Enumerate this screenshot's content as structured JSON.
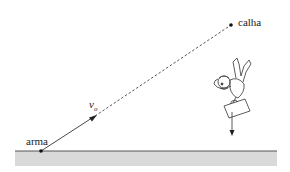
{
  "diagram": {
    "labels": {
      "gun": "arma",
      "gutter": "calha",
      "velocity": "v",
      "velocity_subscript": "o"
    },
    "colors": {
      "ground": "#d9d9d9",
      "ground_line": "#555555",
      "line": "#333333"
    },
    "points": {
      "gun": {
        "x": 41,
        "y": 151
      },
      "gutter": {
        "x": 231,
        "y": 25
      }
    }
  }
}
